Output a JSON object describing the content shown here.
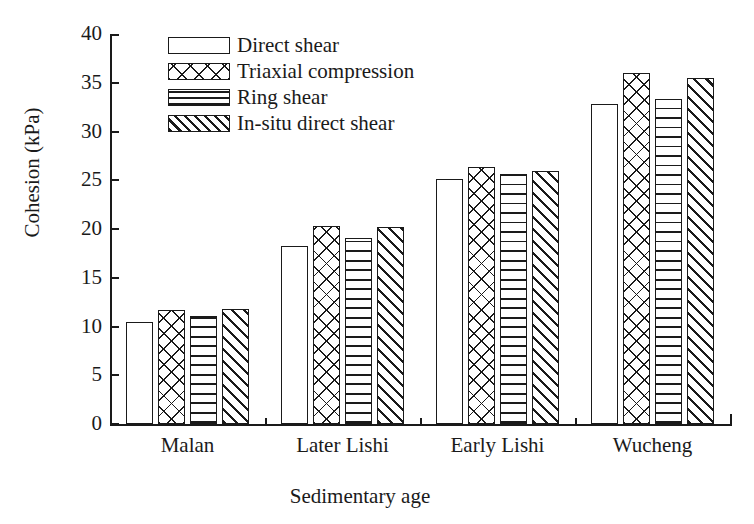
{
  "chart_data": {
    "type": "bar",
    "title": "",
    "xlabel": "Sedimentary age",
    "ylabel": "Cohesion (kPa)",
    "categories": [
      "Malan",
      "Later Lishi",
      "Early Lishi",
      "Wucheng"
    ],
    "ylim": [
      0,
      40
    ],
    "yticks": [
      0,
      5,
      10,
      15,
      20,
      25,
      30,
      35,
      40
    ],
    "ytick_labels": [
      "0",
      "5",
      "10",
      "15",
      "20",
      "25",
      "30",
      "35",
      "40"
    ],
    "grid": false,
    "legend_position": "upper-left-inside",
    "series": [
      {
        "name": "Direct shear",
        "pattern": "empty",
        "values": [
          10.5,
          18.3,
          25.1,
          32.8
        ]
      },
      {
        "name": "Triaxial compression",
        "pattern": "cross-hatch",
        "values": [
          11.7,
          20.3,
          26.4,
          36.0
        ]
      },
      {
        "name": "Ring shear",
        "pattern": "horizontal-lines",
        "values": [
          11.1,
          19.1,
          25.6,
          33.3
        ]
      },
      {
        "name": "In-situ direct shear",
        "pattern": "diagonal-hatch",
        "values": [
          11.8,
          20.2,
          26.0,
          35.5
        ]
      }
    ],
    "colors": {
      "ink": "#1a1a1a",
      "fill": "#ffffff",
      "background": "#ffffff"
    }
  },
  "legend": {
    "items": [
      {
        "label": "Direct shear"
      },
      {
        "label": "Triaxial compression"
      },
      {
        "label": "Ring shear"
      },
      {
        "label": "In-situ direct shear"
      }
    ]
  }
}
